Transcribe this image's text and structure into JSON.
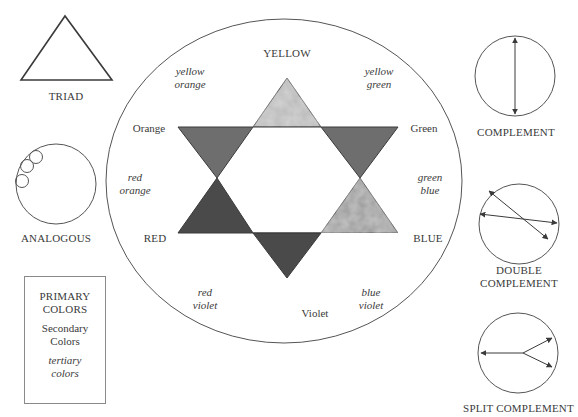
{
  "wheel": {
    "primaries": [
      {
        "label": "YELLOW",
        "position": "top"
      },
      {
        "label": "RED",
        "position": "lower-left"
      },
      {
        "label": "BLUE",
        "position": "lower-right"
      }
    ],
    "secondaries": [
      {
        "label": "Orange",
        "position": "upper-left"
      },
      {
        "label": "Green",
        "position": "upper-right"
      },
      {
        "label": "Violet",
        "position": "bottom"
      }
    ],
    "tertiaries": [
      {
        "line1": "yellow",
        "line2": "orange"
      },
      {
        "line1": "yellow",
        "line2": "green"
      },
      {
        "line1": "red",
        "line2": "orange"
      },
      {
        "line1": "green",
        "line2": "blue"
      },
      {
        "line1": "red",
        "line2": "violet"
      },
      {
        "line1": "blue",
        "line2": "violet"
      }
    ],
    "triangle_fills": {
      "yellow": "#b8b8b8",
      "orange": "#6e6e6e",
      "green": "#6e6e6e",
      "red": "#4a4a4a",
      "blue": "#9a9a9a",
      "violet": "#4a4a4a"
    }
  },
  "schemes": {
    "triad": "TRIAD",
    "analogous": "ANALOGOUS",
    "complement": "COMPLEMENT",
    "double_complement_line1": "DOUBLE",
    "double_complement_line2": "COMPLEMENT",
    "split_complement": "SPLIT COMPLEMENT"
  },
  "legend": {
    "primary_line1": "PRIMARY",
    "primary_line2": "COLORS",
    "secondary_line1": "Secondary",
    "secondary_line2": "Colors",
    "tertiary_line1": "tertiary",
    "tertiary_line2": "colors"
  }
}
